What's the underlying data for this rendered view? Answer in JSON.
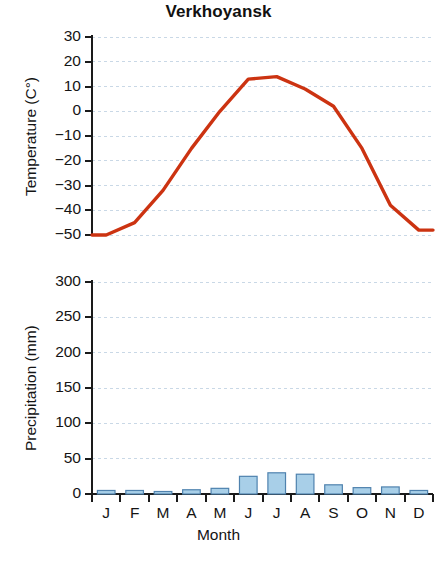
{
  "chart_data": {
    "type": "line",
    "title": "Verkhoyansk",
    "xlabel": "Month",
    "categories": [
      "J",
      "F",
      "M",
      "A",
      "M",
      "J",
      "J",
      "A",
      "S",
      "O",
      "N",
      "D"
    ],
    "panels": [
      {
        "id": "temperature",
        "type": "line",
        "ylabel": "Temperature (C°)",
        "ylim": [
          -50,
          30
        ],
        "ytick_labels": [
          "30",
          "20",
          "10",
          "0",
          "−10",
          "−20",
          "−30",
          "−40",
          "−50"
        ],
        "ytick_values": [
          30,
          20,
          10,
          0,
          -10,
          -20,
          -30,
          -40,
          -50
        ],
        "grid": true,
        "series": [
          {
            "name": "Mean monthly temperature",
            "color": "#cc3311",
            "values": [
              -50,
              -45,
              -32,
              -15,
              0,
              13,
              14,
              9,
              2,
              -15,
              -38,
              -48
            ]
          }
        ]
      },
      {
        "id": "precipitation",
        "type": "bar",
        "ylabel": "Precipitation (mm)",
        "ylim": [
          0,
          300
        ],
        "ytick_labels": [
          "300",
          "250",
          "200",
          "150",
          "100",
          "50",
          "0"
        ],
        "ytick_values": [
          300,
          250,
          200,
          150,
          100,
          50,
          0
        ],
        "grid": true,
        "series": [
          {
            "name": "Mean monthly precipitation",
            "color": "#a8cfe8",
            "border_color": "#4f82ae",
            "values": [
              5,
              5,
              3,
              6,
              8,
              25,
              30,
              28,
              13,
              9,
              10,
              5
            ]
          }
        ]
      }
    ],
    "colors": {
      "temperature_line": "#cc3311",
      "precipitation_bar": "#a8cfe8",
      "precipitation_bar_border": "#4f82ae",
      "axis": "#1a1a1a",
      "gridline": "#c9d8e6",
      "background": "#ffffff"
    }
  }
}
